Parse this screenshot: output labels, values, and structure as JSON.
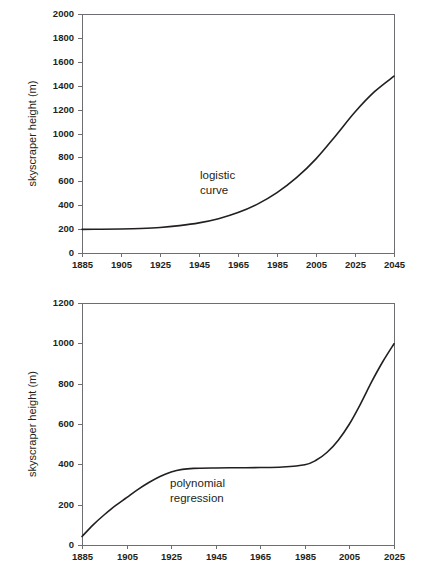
{
  "chart_data": [
    {
      "id": "logistic",
      "type": "line",
      "title": "",
      "xlabel": "",
      "ylabel": "skyscraper height (m)",
      "annotation": "logistic curve",
      "annotation_lines": [
        "logistic",
        "curve"
      ],
      "xlim": [
        1885,
        2045
      ],
      "ylim": [
        0,
        2000
      ],
      "grid": false,
      "legend": "none",
      "line_color": "#231f20",
      "axis_color": "#6d6e71",
      "xticks": [
        1885,
        1905,
        1925,
        1945,
        1965,
        1985,
        2005,
        2025,
        2045
      ],
      "xtick_labels": [
        "1885",
        "1905",
        "1925",
        "1945",
        "1965",
        "1985",
        "2005",
        "2025",
        "2045"
      ],
      "yticks": [
        0,
        200,
        400,
        600,
        800,
        1000,
        1200,
        1400,
        1600,
        1800,
        2000
      ],
      "ytick_labels": [
        "0",
        "200",
        "400",
        "600",
        "800",
        "1000",
        "1200",
        "1400",
        "1600",
        "1800",
        "2000"
      ],
      "x": [
        1885,
        1895,
        1905,
        1915,
        1925,
        1935,
        1945,
        1955,
        1965,
        1975,
        1985,
        1995,
        2005,
        2015,
        2025,
        2035,
        2045
      ],
      "values": [
        198,
        199,
        201,
        205,
        213,
        229,
        252,
        287,
        338,
        409,
        505,
        630,
        788,
        980,
        1180,
        1350,
        1480
      ]
    },
    {
      "id": "polynomial",
      "type": "line",
      "title": "",
      "xlabel": "",
      "ylabel": "skyscraper height (m)",
      "annotation": "polynomial regression",
      "annotation_lines": [
        "polynomial",
        "regression"
      ],
      "xlim": [
        1885,
        2025
      ],
      "ylim": [
        0,
        1200
      ],
      "grid": false,
      "legend": "none",
      "line_color": "#231f20",
      "axis_color": "#6d6e71",
      "xticks": [
        1885,
        1905,
        1925,
        1945,
        1965,
        1985,
        2005,
        2025
      ],
      "xtick_labels": [
        "1885",
        "1905",
        "1925",
        "1945",
        "1965",
        "1985",
        "2005",
        "2025"
      ],
      "yticks": [
        0,
        200,
        400,
        600,
        800,
        1000,
        1200
      ],
      "ytick_labels": [
        "0",
        "200",
        "400",
        "600",
        "800",
        "1000",
        "1200"
      ],
      "x": [
        1885,
        1890,
        1895,
        1900,
        1905,
        1910,
        1915,
        1920,
        1925,
        1930,
        1935,
        1945,
        1955,
        1965,
        1975,
        1985,
        1990,
        1995,
        2000,
        2005,
        2010,
        2015,
        2020,
        2025
      ],
      "values": [
        42,
        100,
        150,
        195,
        235,
        275,
        310,
        340,
        362,
        375,
        380,
        382,
        383,
        384,
        387,
        398,
        420,
        460,
        520,
        600,
        700,
        810,
        910,
        998
      ]
    }
  ]
}
